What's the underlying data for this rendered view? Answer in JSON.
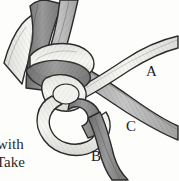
{
  "figure": {
    "kind": "line-drawing-illustration",
    "background_color": "#fdfdfb",
    "ink_color": "#1c1c1c"
  },
  "labels": {
    "a": "A",
    "b": "B",
    "c": "C"
  },
  "body_text": {
    "line1": "with",
    "line2": "Take",
    "line3": ""
  },
  "palette": {
    "rope_dark": "#8d8d8d",
    "rope_dark_shade": "#6f6f6f",
    "rope_mid": "#b4b4b4",
    "rope_light": "#e8e8e4",
    "rope_highlight": "#f4f4f1",
    "outline": "#2b2b2b",
    "hatch": "#3a3a3a"
  },
  "strands": [
    {
      "name": "strand-top-light",
      "fill": "#eeeeea",
      "enters": "top-left"
    },
    {
      "name": "strand-top-dark",
      "fill": "#8d8d8d",
      "enters": "top-left"
    },
    {
      "name": "strand-top-mid",
      "fill": "#b9b9b9",
      "enters": "top-center"
    },
    {
      "name": "strand-a",
      "fill": "#dededa",
      "exits": "right-upper",
      "label": "A"
    },
    {
      "name": "strand-c",
      "fill": "#a9a9a9",
      "exits": "right-lower",
      "label": "C"
    },
    {
      "name": "strand-b",
      "fill": "#8f8f8f",
      "exits": "bottom",
      "label": "B"
    },
    {
      "name": "strand-loop",
      "fill": "#efefeb",
      "shape": "lower-loop"
    }
  ]
}
